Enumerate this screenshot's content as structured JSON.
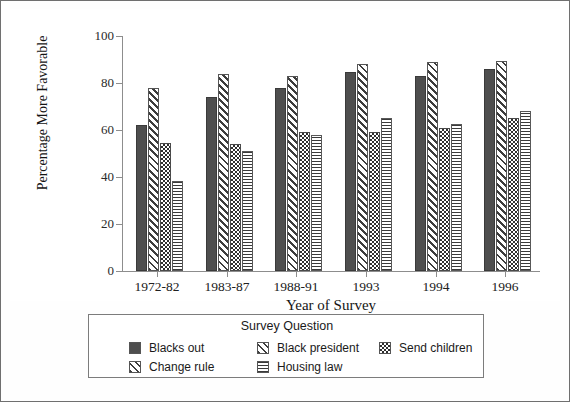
{
  "chart_data": {
    "type": "bar",
    "title": "",
    "xlabel": "Year of Survey",
    "ylabel": "Percentage More Favorable",
    "ylim": [
      0,
      100
    ],
    "yticks": [
      0,
      20,
      40,
      60,
      80,
      100
    ],
    "grid": false,
    "legend_position": "bottom",
    "legend_title": "Survey Question",
    "categories": [
      "1972-82",
      "1983-87",
      "1988-91",
      "1993",
      "1994",
      "1996"
    ],
    "series": [
      {
        "name": "Blacks out",
        "pattern": "solid-dark",
        "values": [
          62,
          74,
          78,
          84.5,
          83,
          86
        ]
      },
      {
        "name": "Change rule",
        "pattern": "diagonal-hatch",
        "values": [
          78,
          84,
          83,
          88,
          89,
          89.5
        ]
      },
      {
        "name": "Black president",
        "pattern": "diagonal-hatch",
        "values": [
          null,
          null,
          null,
          null,
          null,
          null
        ]
      },
      {
        "name": "Send children",
        "pattern": "checkerboard",
        "values": [
          54.5,
          54,
          59,
          59,
          61,
          65
        ]
      },
      {
        "name": "Housing law",
        "pattern": "horizontal-lines",
        "values": [
          38.5,
          51,
          58,
          65,
          62.5,
          68
        ]
      }
    ]
  },
  "axes": {
    "y_label": "Percentage More Favorable",
    "x_label": "Year of Survey",
    "y_ticks": [
      "100",
      "80",
      "60",
      "40",
      "20",
      "0"
    ],
    "x_ticks": [
      "1972-82",
      "1983-87",
      "1988-91",
      "1993",
      "1994",
      "1996"
    ]
  },
  "legend": {
    "title": "Survey Question",
    "items": [
      {
        "label": "Blacks out",
        "pattern": "solid-dark"
      },
      {
        "label": "Black president",
        "pattern": "diagonal-hatch"
      },
      {
        "label": "Send children",
        "pattern": "checkerboard"
      },
      {
        "label": "Change rule",
        "pattern": "diagonal-hatch"
      },
      {
        "label": "Housing law",
        "pattern": "horizontal-lines"
      }
    ]
  },
  "colors": {
    "solid_bar": "#4e4e4e",
    "axis": "#8d8d8d",
    "border": "#6f6f6f",
    "text": "#1a1a1a",
    "background": "#ffffff"
  }
}
